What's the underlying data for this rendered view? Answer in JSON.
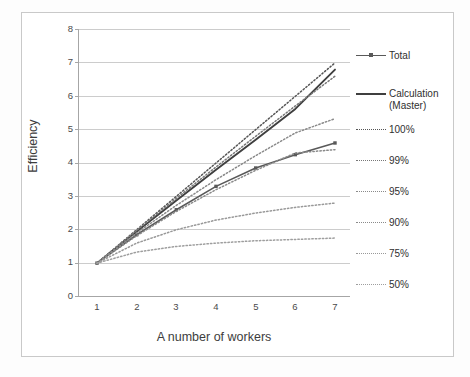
{
  "chart_data": {
    "type": "line",
    "title": "",
    "xlabel": "A number of workers",
    "ylabel": "Efficiency",
    "x": [
      1,
      2,
      3,
      4,
      5,
      6,
      7
    ],
    "xticks": [
      "1",
      "2",
      "3",
      "4",
      "5",
      "6",
      "7"
    ],
    "yticks": [
      "0",
      "1",
      "2",
      "3",
      "4",
      "5",
      "6",
      "7",
      "8"
    ],
    "xlim": [
      1,
      7
    ],
    "ylim": [
      0,
      8
    ],
    "grid": "horizontal",
    "legend_position": "right",
    "series": [
      {
        "name": "Total",
        "style": "solid-markers",
        "color": "#595959",
        "values": [
          1.0,
          1.85,
          2.6,
          3.3,
          3.85,
          4.25,
          4.6
        ]
      },
      {
        "name": "Calculation\n(Master)",
        "style": "solid",
        "color": "#3f3f3f",
        "values": [
          1.0,
          1.95,
          2.88,
          3.8,
          4.7,
          5.62,
          6.8
        ]
      },
      {
        "name": "100%",
        "style": "dotted",
        "color": "#555555",
        "values": [
          1.0,
          2.0,
          3.0,
          4.0,
          5.0,
          6.0,
          7.0
        ]
      },
      {
        "name": "99%",
        "style": "dotted",
        "color": "#777777",
        "values": [
          1.0,
          1.98,
          2.94,
          3.88,
          4.8,
          5.71,
          6.6
        ]
      },
      {
        "name": "95%",
        "style": "dotted",
        "color": "#8a8a8a",
        "values": [
          1.0,
          1.9,
          2.73,
          3.5,
          4.22,
          4.9,
          5.33
        ]
      },
      {
        "name": "90%",
        "style": "dotted",
        "color": "#8a8a8a",
        "values": [
          1.0,
          1.82,
          2.55,
          3.2,
          3.78,
          4.3,
          4.4
        ]
      },
      {
        "name": "75%",
        "style": "dotted",
        "color": "#999999",
        "values": [
          1.0,
          1.6,
          2.0,
          2.29,
          2.5,
          2.67,
          2.8
        ]
      },
      {
        "name": "50%",
        "style": "dotted",
        "color": "#9e9e9e",
        "values": [
          1.0,
          1.33,
          1.5,
          1.6,
          1.67,
          1.71,
          1.75
        ]
      }
    ],
    "legend": [
      {
        "label": "Total",
        "style": "solid-markers"
      },
      {
        "label": "Calculation\n(Master)",
        "style": "solid"
      },
      {
        "label": "100%",
        "style": "dotted"
      },
      {
        "label": "99%",
        "style": "dotted"
      },
      {
        "label": "95%",
        "style": "dotted"
      },
      {
        "label": "90%",
        "style": "dotted"
      },
      {
        "label": "75%",
        "style": "dotted"
      },
      {
        "label": "50%",
        "style": "dotted"
      }
    ],
    "colors": {
      "gridline": "#bfbfbf",
      "axis": "#a6a6a6",
      "frame": "#c9c9c9",
      "text": "#3d3d3d"
    }
  }
}
